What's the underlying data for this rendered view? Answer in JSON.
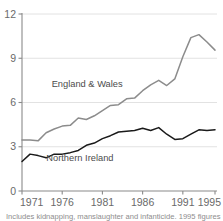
{
  "chart_data": {
    "type": "line",
    "title": "",
    "subtitle": "",
    "xlabel": "",
    "ylabel": "",
    "xlim": [
      1971,
      1995
    ],
    "ylim": [
      0,
      12
    ],
    "yticks": [
      0,
      3,
      6,
      9,
      12
    ],
    "ytick_labels": [
      "0",
      "3",
      "6",
      "9",
      "12"
    ],
    "xticks": [
      1971,
      1976,
      1981,
      1986,
      1991,
      1995
    ],
    "xtick_labels": [
      "1971",
      "1976",
      "1981",
      "1986",
      "1991",
      "1995"
    ],
    "grid": true,
    "grid_axis": "y",
    "legend_position": "inline-annotation",
    "x": [
      1971,
      1972,
      1973,
      1974,
      1975,
      1976,
      1977,
      1978,
      1979,
      1980,
      1981,
      1982,
      1983,
      1984,
      1985,
      1986,
      1987,
      1988,
      1989,
      1990,
      1991,
      1992,
      1993,
      1994,
      1995
    ],
    "series": [
      {
        "name": "England & Wales",
        "color": "#8c8c8c",
        "label_x": 1979.1,
        "label_y": 7.05,
        "values": [
          3.45,
          3.45,
          3.4,
          3.95,
          4.2,
          4.4,
          4.45,
          4.95,
          4.85,
          5.1,
          5.45,
          5.8,
          5.85,
          6.25,
          6.3,
          6.8,
          7.2,
          7.5,
          7.15,
          7.6,
          9.1,
          10.4,
          10.6,
          10.1,
          9.55
        ]
      },
      {
        "name": "Northern Ireland",
        "color": "#1a1a1a",
        "label_x": 1978.2,
        "label_y": 2.05,
        "values": [
          2.0,
          2.5,
          2.4,
          2.25,
          2.5,
          2.5,
          2.6,
          2.75,
          3.1,
          3.25,
          3.55,
          3.75,
          4.0,
          4.05,
          4.1,
          4.25,
          4.1,
          4.3,
          3.85,
          3.5,
          3.55,
          3.85,
          4.15,
          4.1,
          4.15
        ]
      }
    ]
  },
  "footnote": {
    "text": "Includes kidnapping, manslaughter and infanticide. 1995 figures for"
  }
}
